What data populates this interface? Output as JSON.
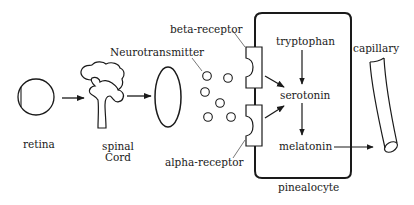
{
  "diagram": {
    "labels": {
      "retina": "retina",
      "spinal": "spinal",
      "cord": "Cord",
      "neurotransmitter": "Neurotransmitter",
      "beta_receptor": "beta-receptor",
      "alpha_receptor": "alpha-receptor",
      "tryptophan": "tryptophan",
      "serotonin": "serotonin",
      "melatonin": "melatonin",
      "capillary": "capillary",
      "pinealocyte": "pinealocyte"
    },
    "colors": {
      "stroke": "#1a1a1a",
      "background": "#ffffff"
    }
  }
}
